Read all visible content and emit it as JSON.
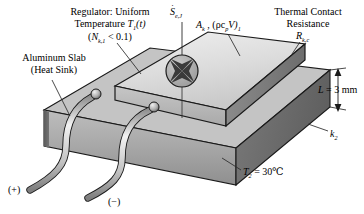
{
  "figure": {
    "type": "engineering-schematic"
  },
  "labels": {
    "regulator_line1": "Regulator: Uniform",
    "regulator_line2_pre": "Temperature ",
    "regulator_line2_sym": "T",
    "regulator_line2_sub": "1",
    "regulator_line2_post": "(t)",
    "regulator_line3_pre": "(",
    "regulator_line3_sym": "N",
    "regulator_line3_sub": "k,1",
    "regulator_line3_post": " < 0.1)",
    "aluminum_line1": "Aluminum Slab",
    "aluminum_line2": "(Heat Sink)",
    "source_sym": "S",
    "source_sub": "e,J",
    "area_sym": "A",
    "area_sub": "k",
    "area_rest": " , (ρc",
    "area_rest_sub": "p",
    "area_rest2": "V)",
    "area_rest2_sub": "1",
    "tcr_line1": "Thermal Contact",
    "tcr_line2": "Resistance",
    "tcr_sym": "R",
    "tcr_sub": "k,c",
    "thickness_sym": "L",
    "thickness_value": " = 3 mm",
    "conductivity_sym": "k",
    "conductivity_sub": "2",
    "temp_sym": "T",
    "temp_sub": "2",
    "temp_value": " = 30℃",
    "terminal_positive": "(+)",
    "terminal_negative": "(−)"
  },
  "values": {
    "thickness_mm": 3,
    "base_temperature_C": 30,
    "biot_number_limit": 0.1
  },
  "icons": {
    "source": "energy-source-star-icon",
    "dimension": "dimension-arrow-icon"
  },
  "colors": {
    "top_face": "#d8d8d8",
    "front_face": "#b4b4b4",
    "side_face": "#787878",
    "slab_front": "#a8a8a8",
    "slab_side": "#6e6e6e",
    "wire": "#cfcfcf",
    "outline": "#1a1a1a",
    "leader": "#2b2b2b"
  }
}
